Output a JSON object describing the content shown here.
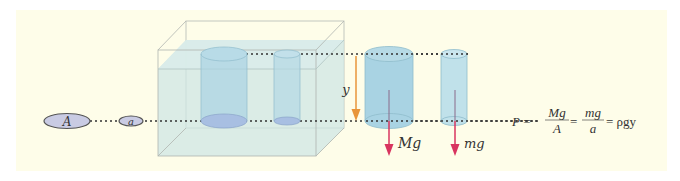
{
  "diagram": {
    "type": "hydrostatic-pressure-illustration",
    "labels": {
      "large_area": "A",
      "small_area": "a",
      "depth": "y",
      "large_weight": "Mg",
      "small_weight": "mg"
    },
    "equation": {
      "lhs": "P =",
      "frac1_num": "Mg",
      "frac1_den": "A",
      "eq2": "=",
      "frac2_num": "mg",
      "frac2_den": "a",
      "rhs": "= ρgy"
    },
    "colors": {
      "background": "#fefde9",
      "water": "#cfe6e4",
      "cylinder": "#a9d3e3",
      "disk": "#c9cbe3",
      "depth_arrow": "#e8953a",
      "weight_arrow": "#d8345f"
    }
  }
}
